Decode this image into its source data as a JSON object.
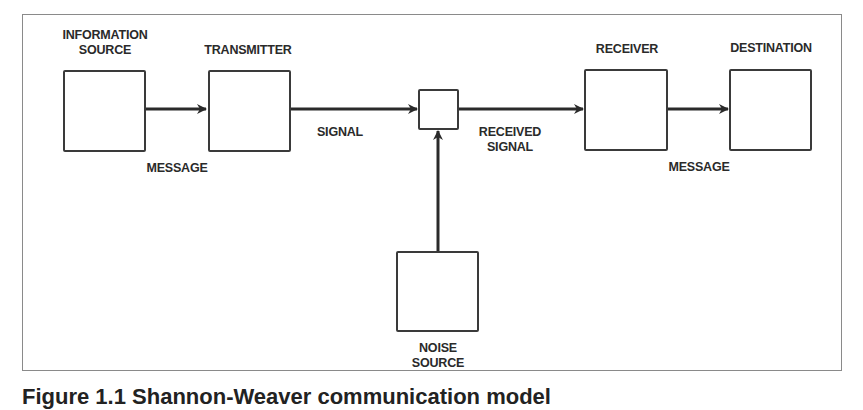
{
  "diagram": {
    "title_nodes": {
      "information_source": "INFORMATION\nSOURCE",
      "transmitter": "TRANSMITTER",
      "receiver": "RECEIVER",
      "destination": "DESTINATION",
      "noise_source": "NOISE\nSOURCE"
    },
    "labels": {
      "info_source_line1": "INFORMATION",
      "info_source_line2": "SOURCE",
      "transmitter": "TRANSMITTER",
      "receiver": "RECEIVER",
      "destination": "DESTINATION",
      "noise_line1": "NOISE",
      "noise_line2": "SOURCE",
      "message_left": "MESSAGE",
      "signal": "SIGNAL",
      "received_line1": "RECEIVED",
      "received_line2": "SIGNAL",
      "message_right": "MESSAGE"
    },
    "edges": [
      {
        "from": "information_source",
        "to": "transmitter",
        "label": "MESSAGE"
      },
      {
        "from": "transmitter",
        "to": "channel",
        "label": "SIGNAL"
      },
      {
        "from": "noise_source",
        "to": "channel",
        "label": ""
      },
      {
        "from": "channel",
        "to": "receiver",
        "label": "RECEIVED SIGNAL"
      },
      {
        "from": "receiver",
        "to": "destination",
        "label": "MESSAGE"
      }
    ],
    "colors": {
      "stroke": "#2a2a2a",
      "frame": "#8a8a8a"
    }
  },
  "caption": "Figure 1.1 Shannon-Weaver communication model"
}
